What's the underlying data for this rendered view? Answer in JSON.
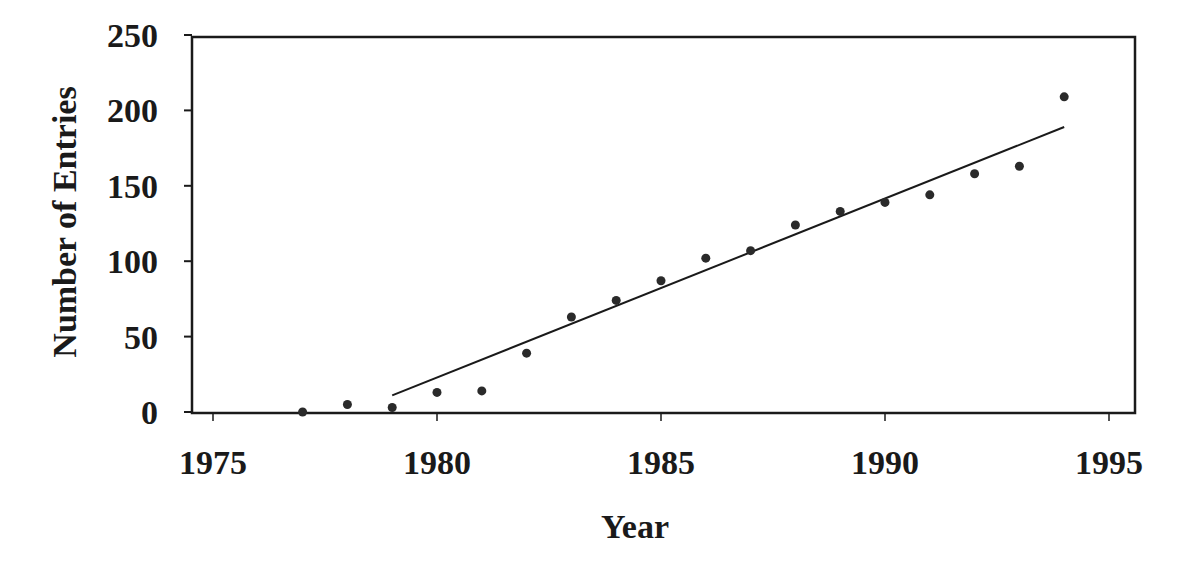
{
  "chart_data": {
    "type": "scatter",
    "title": "",
    "xlabel": "Year",
    "ylabel": "Number of Entries",
    "xlim": [
      1974.5,
      1995.6
    ],
    "ylim": [
      0,
      250
    ],
    "x_ticks": [
      1975,
      1980,
      1985,
      1990,
      1995
    ],
    "y_ticks": [
      0,
      50,
      100,
      150,
      200,
      250
    ],
    "grid": false,
    "legend": null,
    "series": [
      {
        "name": "Entries",
        "type": "scatter",
        "x": [
          1977,
          1978,
          1979,
          1980,
          1981,
          1982,
          1983,
          1984,
          1985,
          1986,
          1987,
          1988,
          1989,
          1990,
          1991,
          1992,
          1993,
          1994
        ],
        "values": [
          0,
          5,
          3,
          13,
          14,
          39,
          63,
          74,
          87,
          102,
          107,
          124,
          133,
          139,
          144,
          158,
          163,
          209
        ]
      },
      {
        "name": "Linear fit",
        "type": "line",
        "x": [
          1979,
          1994
        ],
        "values": [
          11,
          189
        ]
      }
    ]
  },
  "colors": {
    "ink": "#1a1a1a",
    "background": "#ffffff"
  }
}
